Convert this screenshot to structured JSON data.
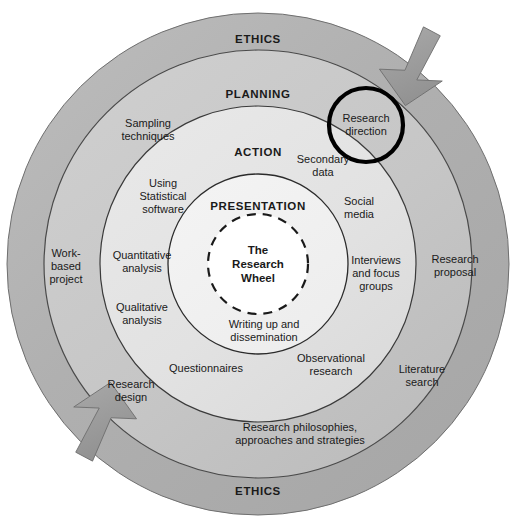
{
  "diagram": {
    "title": "The Research Wheel",
    "type": "concentric-ring-process-diagram",
    "center": {
      "label": "The\nResearch\nWheel"
    },
    "colors": {
      "ring_ethics": "#b3b3b3",
      "ring_planning": "#c9c9c9",
      "ring_action": "#e3e3e3",
      "ring_presentation": "#f1f1f1",
      "ring_core": "#ffffff",
      "stroke": "#1a1a1a",
      "arrow_fill": "#9a9a9a",
      "callout_stroke": "#000000",
      "text": "#1a1a1a"
    },
    "rings": [
      {
        "name": "ethics",
        "title_top": "ETHICS",
        "title_bottom": "ETHICS",
        "outer_radius": 251,
        "inner_radius": 214,
        "fill": "#b3b3b3",
        "items": []
      },
      {
        "name": "planning",
        "title": "PLANNING",
        "outer_radius": 214,
        "inner_radius": 158,
        "fill": "#c9c9c9",
        "items": [
          {
            "label": "Sampling\ntechniques"
          },
          {
            "label": "Research\ndirection",
            "highlighted": true
          },
          {
            "label": "Research\nproposal"
          },
          {
            "label": "Literature\nsearch"
          },
          {
            "label": "Research philosophies,\napproaches and strategies"
          },
          {
            "label": "Research\ndesign"
          },
          {
            "label": "Work-\nbased\nproject"
          }
        ]
      },
      {
        "name": "action",
        "title": "ACTION",
        "outer_radius": 158,
        "inner_radius": 90,
        "fill": "#e3e3e3",
        "items": [
          {
            "label": "Using\nStatistical\nsoftware"
          },
          {
            "label": "Secondary\ndata"
          },
          {
            "label": "Social\nmedia"
          },
          {
            "label": "Interviews\nand focus\ngroups"
          },
          {
            "label": "Observational\nresearch"
          },
          {
            "label": "Questionnaires"
          },
          {
            "label": "Qualitative\nanalysis"
          },
          {
            "label": "Quantitative\nanalysis"
          }
        ]
      },
      {
        "name": "presentation",
        "title": "PRESENTATION",
        "outer_radius": 90,
        "inner_radius": 50,
        "fill": "#f1f1f1",
        "items": [
          {
            "label": "Writing up and\ndissemination"
          }
        ]
      },
      {
        "name": "core",
        "title": "",
        "outer_radius": 50,
        "inner_radius": 0,
        "fill": "#ffffff",
        "dashed_border": true,
        "items": []
      }
    ],
    "arrows": [
      {
        "name": "clockwise-arrow-top-right",
        "direction": "clockwise",
        "position": "top-right"
      },
      {
        "name": "clockwise-arrow-bottom-left",
        "direction": "clockwise",
        "position": "bottom-left"
      }
    ],
    "callout": {
      "name": "research-direction-callout",
      "label": "Research direction",
      "shape": "circle",
      "cx": 366,
      "cy": 125,
      "r": 37
    }
  }
}
